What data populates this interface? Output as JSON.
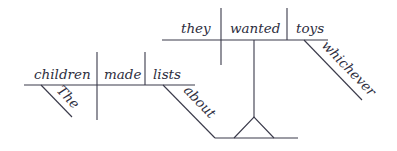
{
  "diagram": {
    "type": "sentence-diagram",
    "main_clause": {
      "subject": "children",
      "verb": "made",
      "object": "lists",
      "subject_modifier": "The",
      "object_modifier": "about"
    },
    "noun_clause": {
      "subject": "they",
      "verb": "wanted",
      "object": "toys",
      "object_modifier": "whichever"
    },
    "colors": {
      "line": "#3a3a4a",
      "text": "#2e2e40",
      "background": "#ffffff"
    }
  }
}
